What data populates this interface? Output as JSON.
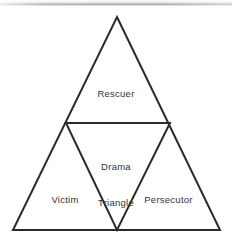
{
  "diagram": {
    "name": "Drama Triangle",
    "type": "nested-triangle-diagram",
    "background_color": "#ffffff",
    "stroke_color": "#2b2b2b",
    "text_color": "#33333a",
    "outer_triangle": {
      "apex": [
        117,
        17
      ],
      "bottom_left": [
        13,
        230
      ],
      "bottom_right": [
        220,
        230
      ]
    },
    "inner_triangle": {
      "left": [
        66,
        123
      ],
      "right": [
        170,
        123
      ],
      "bottom": [
        117,
        230
      ]
    },
    "regions": [
      {
        "id": "rescuer",
        "label": "Rescuer",
        "position": "top"
      },
      {
        "id": "drama-triangle",
        "label": "Drama\nTriangle",
        "position": "center-inverted"
      },
      {
        "id": "victim",
        "label": "Victim",
        "position": "bottom-left"
      },
      {
        "id": "persecutor",
        "label": "Persecutor",
        "position": "bottom-right"
      }
    ],
    "labels": {
      "rescuer": "Rescuer",
      "core_line1": "Drama",
      "core_line2": "Triangle",
      "victim": "Victim",
      "persecutor": "Persecutor"
    }
  }
}
